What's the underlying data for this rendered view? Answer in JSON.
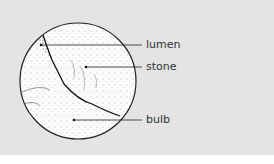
{
  "diagram": {
    "labels": {
      "lumen": "lumen",
      "stone": "stone",
      "bulb": "bulb"
    },
    "colors": {
      "background": "#e4e4e4",
      "ink": "#222222"
    }
  }
}
